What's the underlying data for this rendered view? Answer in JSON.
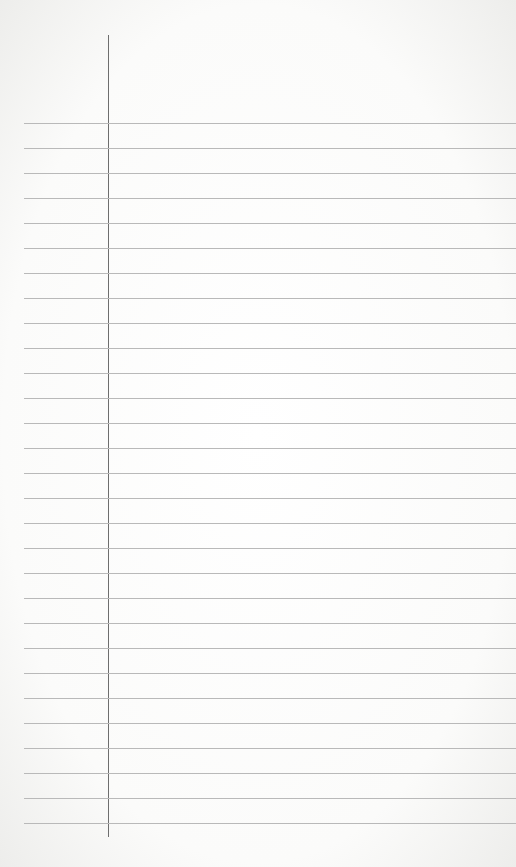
{
  "paper": {
    "type": "lined-paper",
    "background_color": "#ffffff",
    "rule_color": "#b9b9b9",
    "margin_line_color": "#6e6e6e",
    "rule_count": 29,
    "rule_start_y": 123,
    "rule_spacing": 25,
    "margin_line_x": 108,
    "content": ""
  }
}
